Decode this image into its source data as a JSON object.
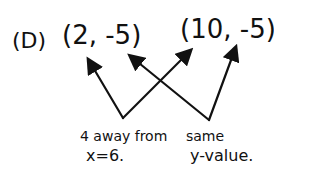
{
  "problem_label": "(D)",
  "points": [
    {
      "text": "(2, -5)"
    },
    {
      "text": "(10, -5)"
    }
  ],
  "notes": [
    {
      "line1": "4 away from",
      "line2": "x=6."
    },
    {
      "line1": "same",
      "line2": "y-value."
    }
  ],
  "ink_color": "#111111"
}
